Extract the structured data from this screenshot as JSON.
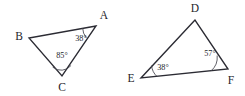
{
  "figure": {
    "background_color": "#ffffff",
    "stroke_color": "#2b2b33",
    "text_color": "#25252c",
    "arc_color": "#43434d",
    "degree_symbol": "°",
    "triangles": [
      {
        "name": "triangle-abc",
        "vertices": [
          {
            "label": "A",
            "x": 96,
            "y": 26,
            "label_x": 104,
            "label_y": 19
          },
          {
            "label": "B",
            "x": 29,
            "y": 38,
            "label_x": 19,
            "label_y": 40
          },
          {
            "label": "C",
            "x": 62,
            "y": 76,
            "label_x": 62,
            "label_y": 91
          }
        ],
        "angles": [
          {
            "at": "A",
            "value": "38",
            "text": "38°",
            "label_x": 81,
            "label_y": 41,
            "arc_r": 13.5
          },
          {
            "at": "C",
            "value": "85",
            "text": "85°",
            "label_x": 62,
            "label_y": 58,
            "arc_r": 12.5
          }
        ]
      },
      {
        "name": "triangle-def",
        "vertices": [
          {
            "label": "D",
            "x": 195,
            "y": 20,
            "label_x": 195,
            "label_y": 12
          },
          {
            "label": "E",
            "x": 141,
            "y": 78,
            "label_x": 131,
            "label_y": 82
          },
          {
            "label": "F",
            "x": 228,
            "y": 69,
            "label_x": 231,
            "label_y": 84
          }
        ],
        "angles": [
          {
            "at": "E",
            "value": "38",
            "text": "38°",
            "label_x": 163,
            "label_y": 70,
            "arc_r": 16
          },
          {
            "at": "F",
            "value": "57",
            "text": "57°",
            "label_x": 210,
            "label_y": 56,
            "arc_r": 17
          }
        ]
      }
    ]
  }
}
